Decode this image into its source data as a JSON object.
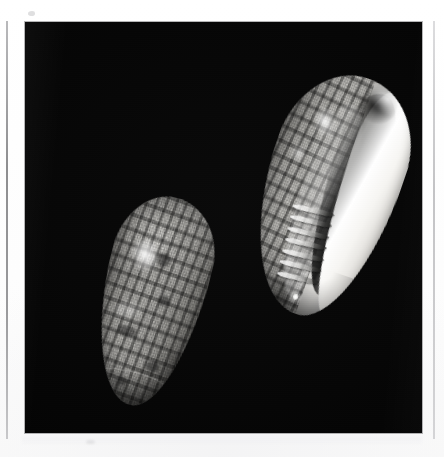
{
  "page": {
    "kind": "scanned-photographic-plate",
    "background_color": "#ffffff",
    "width": 444,
    "height": 457,
    "caption": ""
  },
  "photo": {
    "background_color": "#000000",
    "frame_color": "#ffffff",
    "border_line_color": "#8e8e90",
    "left": 25,
    "top": 22,
    "width": 397,
    "height": 411,
    "subject": "marine gastropod shell, two views",
    "palette": {
      "shell_light": "#f2f1ee",
      "shell_mid": "#b6b5b1",
      "shell_dark": "#3a3a38",
      "aperture_shadow": "#0a0a0a",
      "highlight": "#ffffff"
    }
  },
  "specimens": [
    {
      "id": "shell-dorsal",
      "view_label": "dorsal view",
      "position": "lower left",
      "rotation_deg": 14,
      "outline": "elongate ovate, rounded posterior, tapered anterior",
      "surface_pattern": "tessellated plaid of dark axial streaks crossed by spiral bands",
      "features": [
        "glossy specular highlight on upper-left shoulder",
        "dark blotch clusters in mid-body",
        "incised suture arc near apex",
        "pale basal fasciole band"
      ]
    },
    {
      "id": "shell-ventral",
      "view_label": "ventral / aperture view",
      "position": "upper right",
      "rotation_deg": 19,
      "outline": "ovate with long narrow aperture running nearly full shell length",
      "surface_pattern": "plaid checkering on the dorsal-facing left half, glossy white callus on the right",
      "features": [
        "long dark crescentic aperture groove",
        "thick bright white outer lip",
        "columellar plaits forming oblique folds low on the columella",
        "white speck at the anterior canal",
        "dark notch at the apex / spire"
      ],
      "plait_count": 7
    }
  ],
  "scan_marks": {
    "left_rule_color": "#8e8e90",
    "right_rule_color": "#c3c3c5",
    "left_rule": {
      "x": 6,
      "y": 21,
      "height": 418
    },
    "right_rule": {
      "x": 433,
      "y": 21,
      "height": 418
    },
    "specks": 2
  }
}
